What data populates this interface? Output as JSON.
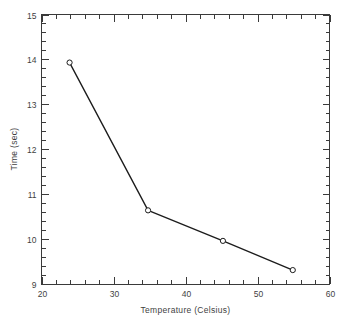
{
  "chart_data": {
    "type": "line",
    "title": "",
    "xlabel": "Temperature (Celsius)",
    "ylabel": "Time (sec)",
    "xlim": [
      20,
      60
    ],
    "ylim": [
      9,
      15
    ],
    "xticks": [
      20,
      30,
      40,
      50,
      60
    ],
    "yticks": [
      9,
      10,
      11,
      12,
      13,
      14,
      15
    ],
    "xtick_labels": [
      "20",
      "30",
      "40",
      "50",
      "60"
    ],
    "ytick_labels": [
      "9",
      "10",
      "11",
      "12",
      "13",
      "14",
      "15"
    ],
    "x_minor_interval": 2,
    "y_minor_interval": 0.2,
    "grid": false,
    "legend": null,
    "marker": "open-circle",
    "x": [
      23.9,
      34.8,
      45.2,
      54.9
    ],
    "y": [
      13.93,
      10.64,
      9.96,
      9.31
    ],
    "points": [
      {
        "x": 23.9,
        "y": 13.93
      },
      {
        "x": 34.8,
        "y": 10.64
      },
      {
        "x": 45.2,
        "y": 9.96
      },
      {
        "x": 54.9,
        "y": 9.31
      }
    ],
    "series": [
      {
        "name": "Time vs Temperature",
        "x": [
          23.9,
          34.8,
          45.2,
          54.9
        ],
        "values": [
          13.93,
          10.64,
          9.96,
          9.31
        ]
      }
    ],
    "colors": {
      "line": "#1c1c1c",
      "marker_face": "#ffffff",
      "marker_edge": "#1c1c1c",
      "axis": "#3a3a3a",
      "text": "#3f3f3f",
      "background": "#ffffff"
    }
  }
}
